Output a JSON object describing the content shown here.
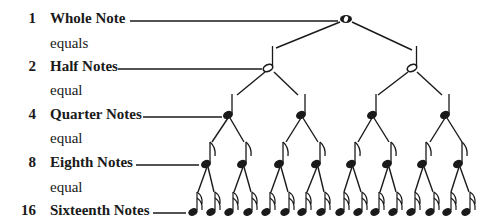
{
  "rows": [
    {
      "count": "1",
      "label": "Whole Note",
      "connector": "equals"
    },
    {
      "count": "2",
      "label": "Half Notes",
      "connector": "equal"
    },
    {
      "count": "4",
      "label": "Quarter Notes",
      "connector": "equal"
    },
    {
      "count": "8",
      "label": "Eighth Notes",
      "connector": "equal"
    },
    {
      "count": "16",
      "label": "Sixteenth Notes"
    }
  ],
  "colors": {
    "ink": "#1a1a1a",
    "background": "#ffffff"
  }
}
